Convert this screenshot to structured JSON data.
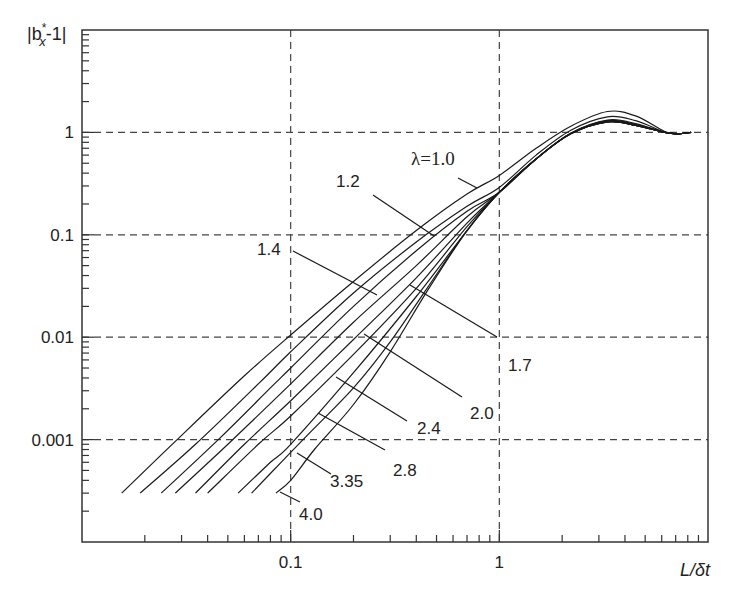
{
  "chart_data": {
    "type": "line",
    "title": "",
    "xlabel": "L/δt",
    "ylabel": "|b*_x - 1|",
    "xscale": "log",
    "yscale": "log",
    "xlim": [
      0.01,
      10
    ],
    "ylim": [
      0.0001,
      10
    ],
    "grid": "dashed at major decades",
    "x_ticks": [
      {
        "value": 0.1,
        "label": "0.1"
      },
      {
        "value": 1,
        "label": "1"
      }
    ],
    "y_ticks": [
      {
        "value": 1,
        "label": "1"
      },
      {
        "value": 0.1,
        "label": "0.1"
      },
      {
        "value": 0.01,
        "label": "0.01"
      },
      {
        "value": 0.001,
        "label": "0.001"
      }
    ],
    "series": [
      {
        "name": "λ=1.0",
        "x": [
          0.0155,
          0.03,
          0.06,
          0.1,
          0.2,
          0.4,
          0.7,
          1.0,
          1.5,
          2.2,
          3.3,
          4.5,
          6.2,
          7.2,
          8.3
        ],
        "y": [
          0.0003,
          0.0011,
          0.0042,
          0.0105,
          0.035,
          0.11,
          0.25,
          0.38,
          0.7,
          1.15,
          1.6,
          1.45,
          1.02,
          0.97,
          1.0
        ]
      },
      {
        "name": "λ=1.2",
        "x": [
          0.019,
          0.035,
          0.07,
          0.1,
          0.2,
          0.4,
          0.7,
          1.0,
          1.5,
          2.2,
          3.3,
          4.5,
          6.2,
          7.2,
          8.3
        ],
        "y": [
          0.0003,
          0.0009,
          0.0035,
          0.0072,
          0.027,
          0.085,
          0.19,
          0.29,
          0.6,
          1.05,
          1.42,
          1.3,
          1.01,
          0.97,
          1.0
        ]
      },
      {
        "name": "λ=1.4",
        "x": [
          0.024,
          0.045,
          0.08,
          0.1,
          0.2,
          0.4,
          0.7,
          1.0,
          1.5,
          2.2,
          3.3,
          4.5,
          6.2,
          7.2,
          8.3
        ],
        "y": [
          0.0003,
          0.001,
          0.0032,
          0.005,
          0.02,
          0.07,
          0.17,
          0.26,
          0.55,
          0.98,
          1.32,
          1.22,
          1.0,
          0.97,
          1.0
        ]
      },
      {
        "name": "λ=1.7",
        "x": [
          0.028,
          0.05,
          0.1,
          0.2,
          0.4,
          0.7,
          1.0,
          1.5,
          2.2,
          3.3,
          4.5,
          6.2,
          7.2,
          8.3
        ],
        "y": [
          0.0003,
          0.0009,
          0.0035,
          0.014,
          0.05,
          0.15,
          0.26,
          0.55,
          0.98,
          1.3,
          1.2,
          1.0,
          0.97,
          1.0
        ]
      },
      {
        "name": "λ=2.0",
        "x": [
          0.035,
          0.06,
          0.1,
          0.2,
          0.4,
          0.7,
          1.0,
          1.5,
          2.2,
          3.3,
          4.5,
          6.2,
          7.2,
          8.3
        ],
        "y": [
          0.0003,
          0.0009,
          0.0024,
          0.0095,
          0.038,
          0.13,
          0.26,
          0.55,
          0.98,
          1.28,
          1.18,
          1.0,
          0.97,
          1.0
        ]
      },
      {
        "name": "λ=2.4",
        "x": [
          0.04,
          0.07,
          0.1,
          0.2,
          0.4,
          0.7,
          1.0,
          1.5,
          2.2,
          3.3,
          4.5,
          6.2,
          7.2,
          8.3
        ],
        "y": [
          0.0003,
          0.0009,
          0.0017,
          0.0068,
          0.03,
          0.12,
          0.26,
          0.55,
          0.97,
          1.27,
          1.17,
          1.0,
          0.97,
          1.0
        ]
      },
      {
        "name": "λ=2.8",
        "x": [
          0.056,
          0.08,
          0.1,
          0.2,
          0.4,
          0.7,
          1.0,
          1.5,
          2.2,
          3.3,
          4.5,
          6.2,
          7.2,
          8.3
        ],
        "y": [
          0.0003,
          0.0006,
          0.0009,
          0.0045,
          0.025,
          0.11,
          0.26,
          0.55,
          0.97,
          1.27,
          1.17,
          1.0,
          0.97,
          1.0
        ]
      },
      {
        "name": "λ=3.35",
        "x": [
          0.065,
          0.09,
          0.12,
          0.2,
          0.3,
          0.45,
          0.7,
          1.0,
          1.5,
          2.2,
          3.3,
          4.5,
          6.2,
          7.2,
          8.3
        ],
        "y": [
          0.0003,
          0.0006,
          0.0011,
          0.0032,
          0.009,
          0.03,
          0.11,
          0.26,
          0.55,
          0.97,
          1.27,
          1.17,
          1.0,
          0.97,
          1.0
        ]
      },
      {
        "name": "λ=4.0",
        "x": [
          0.085,
          0.1,
          0.13,
          0.2,
          0.3,
          0.45,
          0.7,
          1.0,
          1.5,
          2.2,
          3.3,
          4.5,
          6.2,
          7.2,
          8.3
        ],
        "y": [
          0.0003,
          0.0004,
          0.0008,
          0.0022,
          0.0072,
          0.028,
          0.11,
          0.26,
          0.55,
          0.97,
          1.27,
          1.17,
          1.0,
          0.97,
          1.0
        ]
      }
    ],
    "annotations": [
      {
        "text": "λ=1.0",
        "pos_px": [
          411,
          165
        ],
        "leader_px": [
          [
            458,
            178
          ],
          [
            477,
            188
          ]
        ],
        "style": "italic-serif"
      },
      {
        "text": "1.2",
        "pos_px": [
          336,
          187
        ],
        "leader_px": [
          [
            373,
            195
          ],
          [
            434,
            236
          ]
        ]
      },
      {
        "text": "1.4",
        "pos_px": [
          257,
          255
        ],
        "leader_px": [
          [
            293,
            251
          ],
          [
            377,
            295
          ]
        ]
      },
      {
        "text": "1.7",
        "pos_px": [
          508,
          371
        ],
        "leader_px": [
          [
            410,
            285
          ],
          [
            497,
            337
          ]
        ]
      },
      {
        "text": "2.0",
        "pos_px": [
          470,
          419
        ],
        "leader_px": [
          [
            364,
            334
          ],
          [
            462,
            397
          ]
        ]
      },
      {
        "text": "2.4",
        "pos_px": [
          417,
          434
        ],
        "leader_px": [
          [
            336,
            377
          ],
          [
            407,
            421
          ]
        ]
      },
      {
        "text": "2.8",
        "pos_px": [
          393,
          476
        ],
        "leader_px": [
          [
            318,
            413
          ],
          [
            385,
            450
          ]
        ]
      },
      {
        "text": "3.35",
        "pos_px": [
          330,
          487
        ],
        "leader_px": [
          [
            297,
            453
          ],
          [
            331,
            474
          ]
        ]
      },
      {
        "text": "4.0",
        "pos_px": [
          299,
          520
        ],
        "leader_px": [
          [
            280,
            492
          ],
          [
            300,
            502
          ]
        ]
      }
    ]
  },
  "axes": {
    "y_title_main": "|b",
    "y_title_sup": "*",
    "y_title_sub": "x",
    "y_title_tail": "-1|",
    "x_title": "L/δt"
  }
}
